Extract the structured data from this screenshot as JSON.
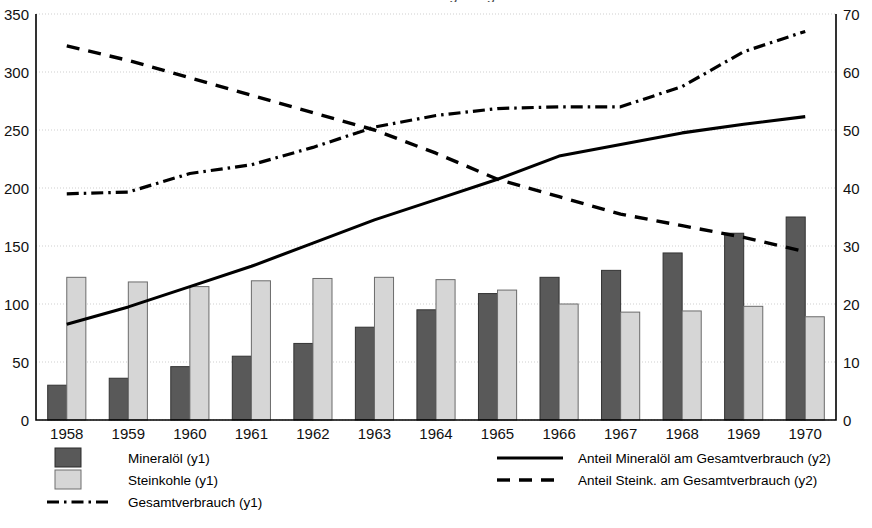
{
  "chart_data": {
    "type": "bar",
    "title": "und der Anteile der Energieträger 1958-1970",
    "xlabel": "",
    "ylabel": "",
    "grid": true,
    "legend_position": "bottom",
    "categories": [
      "1958",
      "1959",
      "1960",
      "1961",
      "1962",
      "1963",
      "1964",
      "1965",
      "1966",
      "1967",
      "1968",
      "1969",
      "1970"
    ],
    "y1": {
      "label": "y1",
      "min": 0,
      "max": 350,
      "ticks": [
        0,
        50,
        100,
        150,
        200,
        250,
        300,
        350
      ],
      "ylim": [
        0,
        350
      ]
    },
    "y2": {
      "label": "y2",
      "min": 0,
      "max": 70,
      "ticks": [
        0,
        10,
        20,
        30,
        40,
        50,
        60,
        70
      ],
      "ylim": [
        0,
        70
      ]
    },
    "series": [
      {
        "name": "Mineralöl (y1)",
        "kind": "bar",
        "axis": "y1",
        "color": "#595959",
        "values": [
          30,
          36,
          46,
          55,
          66,
          80,
          95,
          109,
          123,
          129,
          144,
          161,
          175
        ]
      },
      {
        "name": "Steinkohle (y1)",
        "kind": "bar",
        "axis": "y1",
        "color": "#d6d6d6",
        "values": [
          123,
          119,
          115,
          120,
          122,
          123,
          121,
          112,
          100,
          93,
          94,
          98,
          89
        ]
      },
      {
        "name": "Gesamtverbrauch (y1)",
        "kind": "line",
        "style": "dashdot",
        "axis": "y2",
        "color": "#000000",
        "values": [
          39,
          39.3,
          42.5,
          44,
          47,
          50.5,
          52.5,
          53.7,
          54,
          54,
          57.5,
          63.5,
          67
        ]
      },
      {
        "name": "Anteil Mineralöl am Gesamtverbrauch (y2)",
        "kind": "line",
        "style": "solid",
        "axis": "y2",
        "color": "#000000",
        "values": [
          16.5,
          19.5,
          23,
          26.5,
          30.5,
          34.5,
          38,
          41.5,
          45.5,
          47.5,
          49.5,
          51,
          52.3
        ]
      },
      {
        "name": "Anteil Steink. am Gesamtverbrauch (y2)",
        "kind": "line",
        "style": "dashed",
        "axis": "y2",
        "color": "#000000",
        "values": [
          64.5,
          62,
          59,
          56,
          53,
          50,
          46,
          41.5,
          38.5,
          35.5,
          33.5,
          31.5,
          29
        ]
      }
    ]
  },
  "axes": {
    "left_ticks": [
      "0",
      "50",
      "100",
      "150",
      "200",
      "250",
      "300",
      "350"
    ],
    "right_ticks": [
      "0",
      "10",
      "20",
      "30",
      "40",
      "50",
      "60",
      "70"
    ],
    "x_ticks": [
      "1958",
      "1959",
      "1960",
      "1961",
      "1962",
      "1963",
      "1964",
      "1965",
      "1966",
      "1967",
      "1968",
      "1969",
      "1970"
    ]
  },
  "legend": {
    "left": [
      {
        "label": "Mineralöl (y1)",
        "marker": "swatch-dark"
      },
      {
        "label": "Steinkohle (y1)",
        "marker": "swatch-light"
      },
      {
        "label": "Gesamtverbrauch (y1)",
        "marker": "line-dashdot"
      }
    ],
    "right": [
      {
        "label": "Anteil Mineralöl am Gesamtverbrauch (y2)",
        "marker": "line-solid"
      },
      {
        "label": "Anteil Steink. am Gesamtverbrauch (y2)",
        "marker": "line-dashed"
      }
    ]
  },
  "colors": {
    "bar_dark": "#595959",
    "bar_light": "#d6d6d6",
    "line": "#000000",
    "grid": "#cfcfcf",
    "axis": "#000000"
  }
}
